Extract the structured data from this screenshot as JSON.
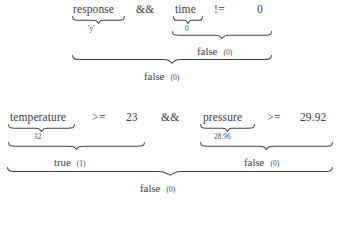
{
  "document": {
    "kind": "expression-evaluation-trace",
    "expressions": [
      {
        "id": "expr-1",
        "source": "response && time != 0",
        "tokens": [
          {
            "text": "response",
            "kind": "variable"
          },
          {
            "text": "&&",
            "kind": "operator"
          },
          {
            "text": "time",
            "kind": "variable"
          },
          {
            "text": "!=",
            "kind": "operator"
          },
          {
            "text": "0",
            "kind": "number"
          }
        ],
        "value_annotations": [
          {
            "for": "response",
            "text": "'y'"
          },
          {
            "for": "time",
            "text": "0"
          }
        ],
        "subresults": [
          {
            "for": "time != 0",
            "value": "false",
            "numeric": "(0)"
          }
        ],
        "result": {
          "value": "false",
          "numeric": "(0)"
        }
      },
      {
        "id": "expr-2",
        "source": "temperature >= 23 && pressure >= 29.92",
        "tokens": [
          {
            "text": "temperature",
            "kind": "variable"
          },
          {
            "text": ">=",
            "kind": "operator"
          },
          {
            "text": "23",
            "kind": "number"
          },
          {
            "text": "&&",
            "kind": "operator"
          },
          {
            "text": "pressure",
            "kind": "variable"
          },
          {
            "text": ">=",
            "kind": "operator"
          },
          {
            "text": "29.92",
            "kind": "number"
          }
        ],
        "value_annotations": [
          {
            "for": "temperature",
            "text": "32"
          },
          {
            "for": "pressure",
            "text": "28.96"
          }
        ],
        "subresults": [
          {
            "for": "temperature >= 23",
            "value": "true",
            "numeric": "(1)"
          },
          {
            "for": "pressure >= 29.92",
            "value": "false",
            "numeric": "(0)"
          }
        ],
        "result": {
          "value": "false",
          "numeric": "(0)"
        }
      }
    ]
  },
  "expr1": {
    "response": "response",
    "and": "&&",
    "time": "time",
    "noteq": "!=",
    "zero": "0",
    "response_val": "'y'",
    "time_val": "0",
    "cmp_result": "false",
    "cmp_result_n": "(0)",
    "final_result": "false",
    "final_result_n": "(0)"
  },
  "expr2": {
    "temperature": "temperature",
    "ge1": ">=",
    "twentythree": "23",
    "and": "&&",
    "pressure": "pressure",
    "ge2": ">=",
    "pressure_limit": "29.92",
    "temperature_val": "32",
    "pressure_val": "28.96",
    "left_result": "true",
    "left_result_n": "(1)",
    "right_result": "false",
    "right_result_n": "(0)",
    "final_result": "false",
    "final_result_n": "(0)"
  },
  "colors": {
    "background": "#ffffff",
    "text": "#3d3d3d",
    "annotation": "#4a4a4a",
    "brace": "#444444"
  }
}
